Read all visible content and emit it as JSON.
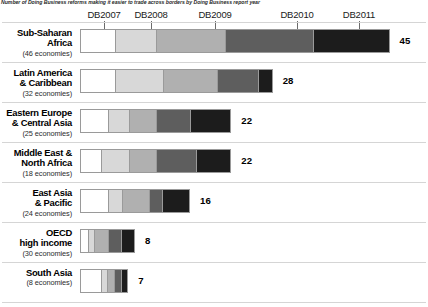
{
  "caption": "Number of Doing Business reforms making it easier to trade across borders by Doing Business report year",
  "chart_data": {
    "type": "bar",
    "title": "Number of Doing Business reforms making it easier to trade across borders by Doing Business report year",
    "subtype": "stacked-horizontal-bar",
    "xlabel": "",
    "ylabel": "",
    "grid": false,
    "legend_position": "top",
    "axis_top_labels": [
      "DB2007",
      "DB2008",
      "DB2009",
      "DB2010",
      "DB2011"
    ],
    "series": [
      {
        "name": "DB2007",
        "color": "#ffffff",
        "values": [
          5,
          5,
          4,
          3,
          4,
          1,
          3
        ]
      },
      {
        "name": "DB2008",
        "color": "#d8d8d8",
        "values": [
          6,
          7,
          3,
          4,
          2,
          1,
          1
        ]
      },
      {
        "name": "DB2009",
        "color": "#b0b0b0",
        "values": [
          10,
          8,
          4,
          4,
          4,
          2,
          1
        ]
      },
      {
        "name": "DB2010",
        "color": "#5e5e5e",
        "values": [
          13,
          6,
          5,
          6,
          2,
          2,
          1
        ]
      },
      {
        "name": "DB2011",
        "color": "#1c1c1c",
        "values": [
          11,
          2,
          6,
          5,
          4,
          2,
          1
        ]
      }
    ],
    "categories": [
      "Sub-Saharan Africa",
      "Latin America & Caribbean",
      "Eastern Europe & Central Asia",
      "Middle East & North Africa",
      "East Asia & Pacific",
      "OECD high income",
      "South Asia"
    ],
    "totals": [
      45,
      28,
      22,
      22,
      16,
      8,
      7
    ],
    "xlim": [
      0,
      45
    ]
  },
  "years": [
    {
      "label": "DB2007",
      "tick_center": 104
    },
    {
      "label": "DB2008",
      "tick_center": 151
    },
    {
      "label": "DB2009",
      "tick_center": 215
    },
    {
      "label": "DB2010",
      "tick_center": 297
    },
    {
      "label": "DB2011",
      "tick_center": 359
    }
  ],
  "rows": [
    {
      "name_line1": "Sub-Saharan",
      "name_line2": "Africa",
      "count": "(46 economies)",
      "total": "45",
      "segments": [
        5,
        6,
        10,
        13,
        11
      ]
    },
    {
      "name_line1": "Latin America",
      "name_line2": "& Caribbean",
      "count": "(32 economies)",
      "total": "28",
      "segments": [
        5,
        7,
        8,
        6,
        2
      ]
    },
    {
      "name_line1": "Eastern Europe",
      "name_line2": "& Central Asia",
      "count": "(25 economies)",
      "total": "22",
      "segments": [
        4,
        3,
        4,
        5,
        6
      ]
    },
    {
      "name_line1": "Middle East &",
      "name_line2": "North Africa",
      "count": "(18 economies)",
      "total": "22",
      "segments": [
        3,
        4,
        4,
        6,
        5
      ]
    },
    {
      "name_line1": "East Asia",
      "name_line2": "& Pacific",
      "count": "(24 economies)",
      "total": "16",
      "segments": [
        4,
        2,
        4,
        2,
        4
      ]
    },
    {
      "name_line1": "OECD",
      "name_line2": "high income",
      "count": "(30 economies)",
      "total": "8",
      "segments": [
        1,
        1,
        2,
        2,
        2
      ]
    },
    {
      "name_line1": "South Asia",
      "name_line2": "",
      "count": "(8 economies)",
      "total": "7",
      "segments": [
        3,
        1,
        1,
        1,
        1
      ]
    }
  ],
  "palette": [
    "#ffffff",
    "#d8d8d8",
    "#b0b0b0",
    "#5e5e5e",
    "#1c1c1c"
  ],
  "layout": {
    "bar_left": 80,
    "unit_px": 6.88,
    "row_tops": [
      28,
      68,
      108,
      148,
      188,
      228,
      268
    ],
    "rule_tops": [
      22,
      62,
      102,
      142,
      182,
      222,
      262,
      302
    ]
  }
}
